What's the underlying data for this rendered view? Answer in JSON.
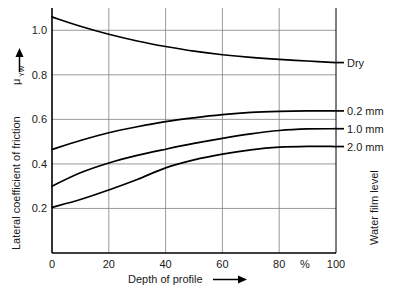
{
  "chart_data": {
    "type": "line",
    "title": "",
    "xlabel": "Depth of profile",
    "ylabel": "Lateral coefficient of friction",
    "ylabel_symbol": "μ",
    "ylabel_symbol_sub": "YW",
    "right_axis_label": "Water film level",
    "x_unit": "%",
    "xlim": [
      0,
      100
    ],
    "ylim": [
      0,
      1.1
    ],
    "xticks": [
      0,
      20,
      40,
      60,
      80,
      100
    ],
    "xtick_labels": [
      "0",
      "20",
      "40",
      "60",
      "80",
      "100"
    ],
    "yticks": [
      0.2,
      0.4,
      0.6,
      0.8,
      1.0
    ],
    "ytick_labels": [
      "0.2",
      "0.4",
      "0.6",
      "0.8",
      "1.0"
    ],
    "grid": true,
    "legend_position": "right-of-axes",
    "line_color": "#000000",
    "grid_color": "#808080",
    "axis_color": "#000000",
    "x": [
      0,
      10,
      20,
      30,
      40,
      50,
      60,
      70,
      80,
      90,
      100
    ],
    "series": [
      {
        "name": "Dry",
        "label": "Dry",
        "values": [
          1.06,
          1.018,
          0.982,
          0.952,
          0.927,
          0.906,
          0.89,
          0.878,
          0.869,
          0.862,
          0.855
        ]
      },
      {
        "name": "0.2 mm",
        "label": "0.2 mm",
        "values": [
          0.465,
          0.505,
          0.54,
          0.567,
          0.59,
          0.607,
          0.621,
          0.631,
          0.636,
          0.638,
          0.638
        ]
      },
      {
        "name": "1.0 mm",
        "label": "1.0 mm",
        "values": [
          0.3,
          0.36,
          0.404,
          0.438,
          0.466,
          0.492,
          0.515,
          0.535,
          0.55,
          0.557,
          0.558
        ]
      },
      {
        "name": "2.0 mm",
        "label": "2.0 mm",
        "values": [
          0.205,
          0.24,
          0.283,
          0.33,
          0.382,
          0.418,
          0.444,
          0.463,
          0.475,
          0.479,
          0.478
        ]
      }
    ]
  }
}
